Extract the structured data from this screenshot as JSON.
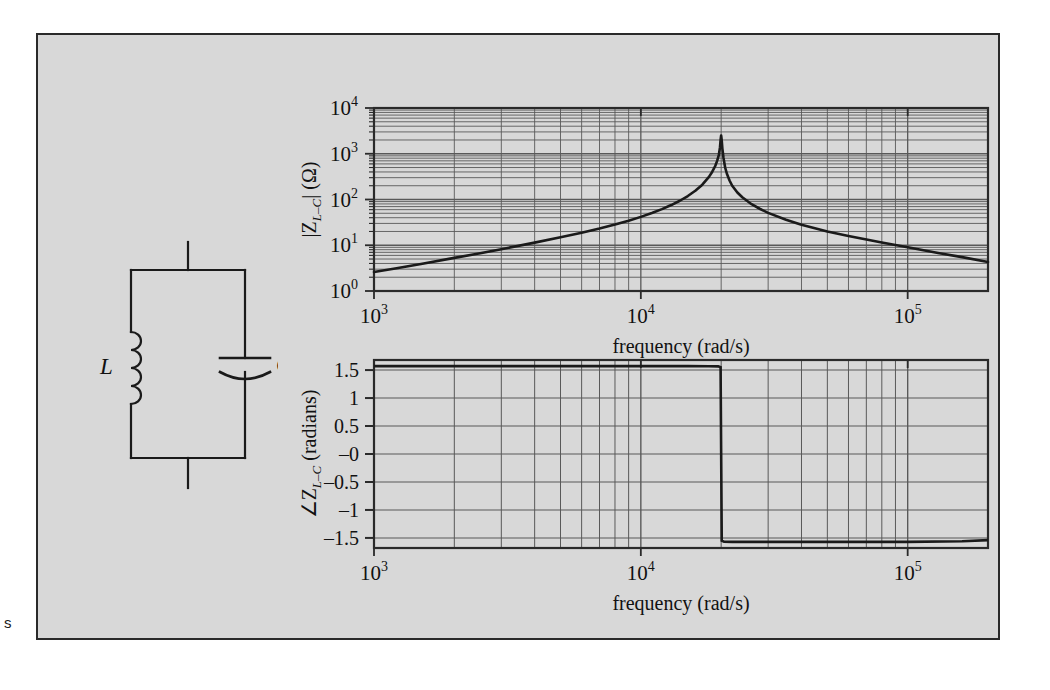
{
  "page": {
    "margin_note": "s",
    "background": "#ffffff",
    "figure_background": "#d8d8d8",
    "frame_color": "#2a2a2a",
    "curve_color": "#1a1a1a",
    "grid_color": "#595959"
  },
  "circuit": {
    "name": "parallel-lc-circuit",
    "topology": "parallel",
    "components": [
      {
        "id": "inductor",
        "label": "L",
        "symbol": "coil",
        "branch": "left",
        "turns": 4
      },
      {
        "id": "capacitor",
        "label": "C",
        "symbol": "parallel-plates",
        "branch": "right"
      }
    ],
    "terminals": [
      "top",
      "bottom"
    ]
  },
  "chart_data": [
    {
      "id": "magnitude",
      "type": "line",
      "title": "",
      "xlabel": "frequency (rad/s)",
      "ylabel": "|Z_{L-C}| (Ω)",
      "ylabel_parts": {
        "prefix": "|Z",
        "sub": "L–C",
        "suffix": "| (Ω)"
      },
      "xscale": "log",
      "yscale": "log",
      "xlim": [
        1000,
        200000
      ],
      "ylim": [
        1,
        10000
      ],
      "xticks": [
        1000,
        10000,
        100000
      ],
      "xticklabels": [
        "10^3",
        "10^4",
        "10^5"
      ],
      "xtick_mantissas": [
        "10",
        "10",
        "10"
      ],
      "xtick_exponents": [
        "3",
        "4",
        "5"
      ],
      "yticks": [
        1,
        10,
        100,
        1000,
        10000
      ],
      "yticklabels": [
        "10^0",
        "10^1",
        "10^2",
        "10^3",
        "10^4"
      ],
      "ytick_mantissas": [
        "10",
        "10",
        "10",
        "10",
        "10"
      ],
      "ytick_exponents": [
        "0",
        "1",
        "2",
        "3",
        "4"
      ],
      "grid": "log-minor-both",
      "legend": "none",
      "resonance_frequency": 20000,
      "peak_value": 2500,
      "series": [
        {
          "name": "|Z_L-C|",
          "x": [
            1000,
            1200,
            1500,
            2000,
            2500,
            3000,
            4000,
            5000,
            6000,
            7000,
            8000,
            9000,
            10000,
            11000,
            12000,
            13000,
            14000,
            15000,
            16000,
            17000,
            18000,
            18500,
            19000,
            19300,
            19600,
            19800,
            19900,
            20000,
            20100,
            20200,
            20400,
            20700,
            21000,
            21500,
            22000,
            23000,
            24000,
            26000,
            28000,
            30000,
            35000,
            40000,
            50000,
            60000,
            80000,
            100000,
            130000,
            160000,
            200000
          ],
          "y": [
            2.6,
            3.1,
            3.9,
            5.3,
            6.7,
            8.2,
            11.4,
            14.9,
            18.8,
            23.2,
            28.4,
            34.5,
            41.7,
            50.6,
            61.6,
            75.6,
            93.9,
            119,
            155,
            211,
            312,
            400,
            540,
            690,
            930,
            1390,
            2000,
            2500,
            1950,
            1330,
            820,
            500,
            370,
            260,
            200,
            142,
            112,
            79,
            62,
            51,
            36,
            28,
            20,
            16,
            11.5,
            9.0,
            6.8,
            5.5,
            4.3
          ]
        }
      ]
    },
    {
      "id": "phase",
      "type": "line",
      "title": "",
      "xlabel": "frequency (rad/s)",
      "ylabel": "∠Z_{L-C} (radians)",
      "ylabel_parts": {
        "prefix": "∠Z",
        "sub": "L–C",
        "suffix": " (radians)"
      },
      "xscale": "log",
      "yscale": "linear",
      "xlim": [
        1000,
        200000
      ],
      "ylim": [
        -1.68,
        1.68
      ],
      "xticks": [
        1000,
        10000,
        100000
      ],
      "xticklabels": [
        "10^3",
        "10^4",
        "10^5"
      ],
      "xtick_mantissas": [
        "10",
        "10",
        "10"
      ],
      "xtick_exponents": [
        "3",
        "4",
        "5"
      ],
      "yticks": [
        -1.5,
        -1,
        -0.5,
        0,
        0.5,
        1,
        1.5
      ],
      "yticklabels": [
        "–1.5",
        "–1",
        "–0.5",
        "–0",
        "0.5",
        "1",
        "1.5"
      ],
      "grid": "log-x-linear-y",
      "legend": "none",
      "resonance_frequency": 20000,
      "series": [
        {
          "name": "∠Z_L-C",
          "x": [
            1000,
            5000,
            10000,
            15000,
            18000,
            19500,
            19900,
            20000,
            20100,
            20500,
            22000,
            30000,
            50000,
            100000,
            160000,
            200000
          ],
          "y": [
            1.571,
            1.571,
            1.57,
            1.57,
            1.569,
            1.566,
            1.55,
            0.0,
            -1.55,
            -1.568,
            -1.57,
            -1.571,
            -1.571,
            -1.57,
            -1.56,
            -1.54
          ]
        }
      ]
    }
  ]
}
